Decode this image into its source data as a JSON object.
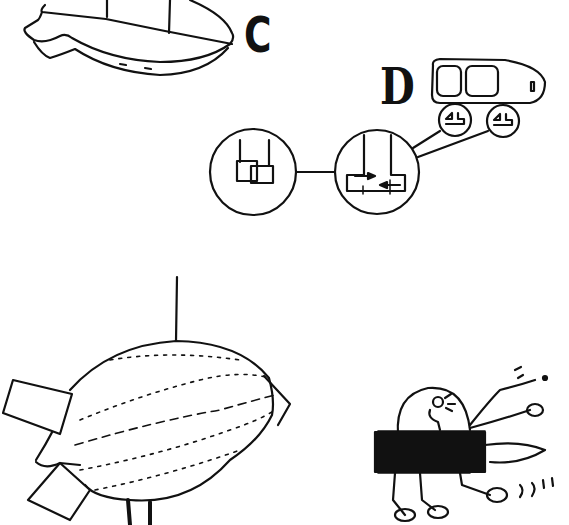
{
  "labels": {
    "c": "C",
    "d": "D"
  },
  "figures": [
    {
      "id": "airship-gondola-c",
      "description": "Airship hull/gondola underside outline, label C"
    },
    {
      "id": "vehicle-d",
      "description": "Rounded vehicle cabin with two windows on two suction-cup wheels, label D"
    },
    {
      "id": "connector-circles",
      "description": "Two linked magnified circles: overlapping squares and sliding plates with arrows"
    },
    {
      "id": "blimp",
      "description": "Dotted-line blimp hanging from a string with two box fins"
    },
    {
      "id": "runner-machine",
      "description": "Cartoon figure in a dome riding a scribbled box with legs"
    }
  ],
  "colors": {
    "ink": "#111111",
    "background": "#ffffff"
  }
}
